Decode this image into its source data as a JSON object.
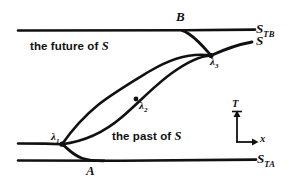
{
  "figure": {
    "caption_present": false,
    "background_color": "#ffffff",
    "ink_color": "#111111"
  },
  "regions": {
    "future_label": "the future of ",
    "future_symbol": "S",
    "past_label": "the past of ",
    "past_symbol": "S"
  },
  "points": {
    "b_label": "B",
    "a_label": "A"
  },
  "surfaces": {
    "top_name": "S",
    "top_sub": "TB",
    "middle_name": "S",
    "bottom_name": "S",
    "bottom_sub": "TA"
  },
  "intersections": {
    "lambda1": {
      "symbol": "λ",
      "sub": "1"
    },
    "lambda2": {
      "symbol": "λ",
      "sub": "2"
    },
    "lambda3": {
      "symbol": "λ",
      "sub": "3"
    }
  },
  "axes": {
    "vertical_label": "T",
    "horizontal_label": "x"
  }
}
